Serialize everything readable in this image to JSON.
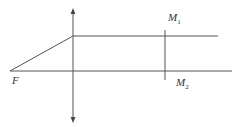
{
  "diagram": {
    "type": "optics-ray-diagram",
    "colors": {
      "line": "#555555",
      "text": "#333333",
      "background": "#ffffff"
    },
    "labels": {
      "focus": "F",
      "mirror1": {
        "main": "M",
        "sub": "1"
      },
      "mirror2": {
        "main": "M",
        "sub": "2"
      }
    },
    "elements": {
      "lens": {
        "x": 73,
        "y_top": 9,
        "y_bottom": 122,
        "arrows": "both"
      },
      "optical_axis": {
        "x1": 10,
        "y": 71,
        "x2": 232
      },
      "incident_ray": {
        "x1": 10,
        "y1": 71,
        "x2": 73,
        "y2": 36
      },
      "parallel_ray": {
        "x1": 73,
        "y": 36,
        "x2": 218
      },
      "mirror_plane": {
        "x": 165,
        "y_top": 30,
        "y_bottom": 80
      }
    }
  }
}
